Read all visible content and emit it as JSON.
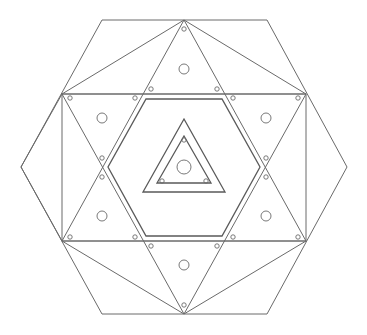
{
  "diagram": {
    "stroke_color": "#6a6a6a",
    "background": "#ffffff",
    "outer_hexagon": [
      [
        102,
        20
      ],
      [
        267,
        20
      ],
      [
        347,
        167
      ],
      [
        267,
        314
      ],
      [
        102,
        314
      ],
      [
        21,
        167
      ]
    ],
    "rectangle": {
      "x": 62,
      "y": 94,
      "w": 244,
      "h": 147
    },
    "top_fan_apex": [
      184,
      20
    ],
    "bottom_fan_apex": [
      184,
      314
    ],
    "hexagram_up": [
      [
        184,
        20
      ],
      [
        306,
        241
      ],
      [
        62,
        241
      ]
    ],
    "hexagram_down": [
      [
        184,
        314
      ],
      [
        306,
        94
      ],
      [
        62,
        94
      ]
    ],
    "inner_hexagon": [
      [
        146,
        99
      ],
      [
        222,
        99
      ],
      [
        260,
        167
      ],
      [
        222,
        236
      ],
      [
        146,
        236
      ],
      [
        108,
        167
      ]
    ],
    "center_triangle_outer": [
      [
        184,
        119
      ],
      [
        225,
        192
      ],
      [
        143,
        192
      ]
    ],
    "center_triangle_inner": [
      [
        184,
        136
      ],
      [
        211,
        183
      ],
      [
        157,
        183
      ]
    ],
    "large_circles": [
      [
        184,
        69,
        5
      ],
      [
        102,
        118,
        5
      ],
      [
        266,
        118,
        5
      ],
      [
        102,
        216,
        5
      ],
      [
        266,
        216,
        5
      ],
      [
        184,
        265,
        5
      ],
      [
        184,
        167,
        7
      ]
    ],
    "small_circles": [
      [
        184,
        29
      ],
      [
        151,
        89
      ],
      [
        217,
        89
      ],
      [
        70,
        98
      ],
      [
        135,
        98
      ],
      [
        233,
        98
      ],
      [
        298,
        98
      ],
      [
        102,
        156
      ],
      [
        266,
        156
      ],
      [
        102,
        177
      ],
      [
        266,
        177
      ],
      [
        70,
        237
      ],
      [
        135,
        237
      ],
      [
        233,
        237
      ],
      [
        298,
        237
      ],
      [
        151,
        246
      ],
      [
        217,
        246
      ],
      [
        184,
        305
      ],
      [
        184,
        140
      ],
      [
        162,
        181
      ],
      [
        206,
        181
      ]
    ]
  }
}
